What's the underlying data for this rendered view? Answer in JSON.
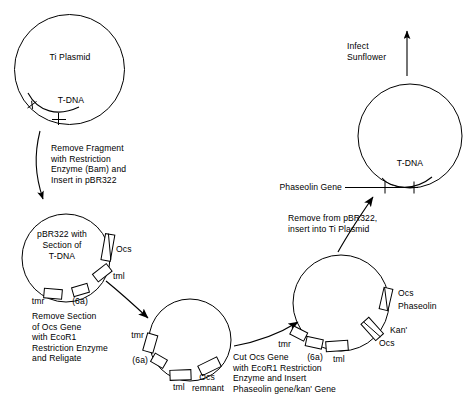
{
  "diagram": {
    "stroke_color": "#000000",
    "background_color": "#ffffff"
  },
  "plasmids": {
    "ti_plasmid": {
      "name": "ti-plasmid",
      "center_label": "Ti Plasmid",
      "region_label": "T-DNA"
    },
    "pbr322_with_tdna": {
      "name": "pbr322-with-tdna",
      "center_label_line1": "pBR322 with",
      "center_label_line2": "Section of",
      "center_label_line3": "T-DNA",
      "genes": [
        {
          "label": "Ocs"
        },
        {
          "label": "tml"
        },
        {
          "label": "(6a)"
        },
        {
          "label": "tmr"
        }
      ]
    },
    "pbr322_ocs_removed": {
      "name": "pbr322-ocs-removed",
      "genes": [
        {
          "label": "tmr"
        },
        {
          "label": "(6a)"
        },
        {
          "label": "tml"
        },
        {
          "label": "Ocs"
        },
        {
          "label": "remnant"
        }
      ]
    },
    "pbr322_phaseolin": {
      "name": "pbr322-with-phaseolin",
      "genes": [
        {
          "label": "Ocs"
        },
        {
          "label": "Phaseolin"
        },
        {
          "label": "Kan'"
        },
        {
          "label": "Ocs"
        },
        {
          "label": "tml"
        },
        {
          "label": "(6a)"
        },
        {
          "label": "tmr"
        }
      ]
    },
    "ti_plasmid_recombinant": {
      "name": "ti-plasmid-recombinant",
      "region_label": "T-DNA",
      "insert_label": "Phaseolin Gene"
    }
  },
  "steps": {
    "step1": {
      "name": "remove-fragment-step",
      "text": "Remove Fragment\nwith Restriction\nEnzyme (Bam) and\nInsert in pBR322"
    },
    "step2": {
      "name": "remove-ocs-step",
      "text": "Remove Section\nof Ocs Gene\nwith EcoR1\nRestriction Enzyme\nand Religate"
    },
    "step3": {
      "name": "cut-ocs-insert-step",
      "text": "Cut Ocs Gene\nwith EcoR1 Restriction\nEnzyme and Insert\nPhaseolin gene/kan' Gene"
    },
    "step4": {
      "name": "reinsert-ti-step",
      "text": "Remove from pBR322,\ninsert into Ti Plasmid"
    },
    "step5": {
      "name": "infect-step",
      "text": "Infect\nSunflower"
    }
  }
}
